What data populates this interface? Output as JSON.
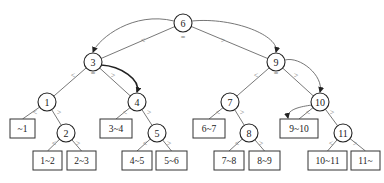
{
  "diagram": {
    "type": "search-tree-with-interval-leaves",
    "operators": {
      "less": "<",
      "equal": "=",
      "greater": ">"
    },
    "nodes": [
      {
        "id": "6",
        "label": "6",
        "x": 183,
        "y": 23
      },
      {
        "id": "3",
        "label": "3",
        "x": 93,
        "y": 62
      },
      {
        "id": "9",
        "label": "9",
        "x": 276,
        "y": 62
      },
      {
        "id": "1",
        "label": "1",
        "x": 47,
        "y": 102
      },
      {
        "id": "4",
        "label": "4",
        "x": 137,
        "y": 102
      },
      {
        "id": "7",
        "label": "7",
        "x": 230,
        "y": 102
      },
      {
        "id": "10",
        "label": "10",
        "x": 320,
        "y": 102
      },
      {
        "id": "2",
        "label": "2",
        "x": 66,
        "y": 133
      },
      {
        "id": "5",
        "label": "5",
        "x": 157,
        "y": 133
      },
      {
        "id": "8",
        "label": "8",
        "x": 249,
        "y": 133
      },
      {
        "id": "11",
        "label": "11",
        "x": 343,
        "y": 133
      }
    ],
    "leaves": [
      {
        "id": "lt1",
        "label": "~1",
        "x": 10,
        "y": 119,
        "w": 25,
        "h": 19
      },
      {
        "id": "1to2",
        "label": "1~2",
        "x": 33,
        "y": 151,
        "w": 29,
        "h": 19
      },
      {
        "id": "2to3",
        "label": "2~3",
        "x": 67,
        "y": 151,
        "w": 29,
        "h": 19
      },
      {
        "id": "3to4",
        "label": "3~4",
        "x": 100,
        "y": 119,
        "w": 32,
        "h": 19
      },
      {
        "id": "4to5",
        "label": "4~5",
        "x": 122,
        "y": 151,
        "w": 30,
        "h": 19
      },
      {
        "id": "5to6",
        "label": "5~6",
        "x": 156,
        "y": 151,
        "w": 31,
        "h": 19
      },
      {
        "id": "6to7",
        "label": "6~7",
        "x": 193,
        "y": 119,
        "w": 32,
        "h": 19
      },
      {
        "id": "7to8",
        "label": "7~8",
        "x": 214,
        "y": 151,
        "w": 30,
        "h": 19
      },
      {
        "id": "8to9",
        "label": "8~9",
        "x": 249,
        "y": 151,
        "w": 31,
        "h": 19
      },
      {
        "id": "9to10",
        "label": "9~10",
        "x": 280,
        "y": 119,
        "w": 38,
        "h": 19
      },
      {
        "id": "10to11",
        "label": "10~11",
        "x": 308,
        "y": 151,
        "w": 39,
        "h": 19
      },
      {
        "id": "gt11",
        "label": "11~",
        "x": 351,
        "y": 151,
        "w": 29,
        "h": 19
      }
    ],
    "edges": [
      {
        "from": "6",
        "to": "3"
      },
      {
        "from": "6",
        "to": "9"
      },
      {
        "from": "3",
        "to": "1"
      },
      {
        "from": "3",
        "to": "4"
      },
      {
        "from": "9",
        "to": "7"
      },
      {
        "from": "9",
        "to": "10"
      },
      {
        "from": "1",
        "to": "lt1"
      },
      {
        "from": "1",
        "to": "2"
      },
      {
        "from": "2",
        "to": "1to2"
      },
      {
        "from": "2",
        "to": "2to3"
      },
      {
        "from": "4",
        "to": "3to4"
      },
      {
        "from": "4",
        "to": "5"
      },
      {
        "from": "5",
        "to": "4to5"
      },
      {
        "from": "5",
        "to": "5to6"
      },
      {
        "from": "7",
        "to": "6to7"
      },
      {
        "from": "7",
        "to": "8"
      },
      {
        "from": "8",
        "to": "7to8"
      },
      {
        "from": "8",
        "to": "8to9"
      },
      {
        "from": "10",
        "to": "9to10"
      },
      {
        "from": "10",
        "to": "11"
      },
      {
        "from": "11",
        "to": "10to11"
      },
      {
        "from": "11",
        "to": "gt11"
      }
    ],
    "search_arrows": [
      {
        "from": "6",
        "to": "3",
        "bold": false
      },
      {
        "from": "3",
        "to": "4",
        "bold": true
      },
      {
        "from": "6",
        "to": "9",
        "bold": false
      },
      {
        "from": "9",
        "to": "10",
        "bold": false
      },
      {
        "from": "10",
        "to": "9to10",
        "bold": false
      }
    ]
  }
}
